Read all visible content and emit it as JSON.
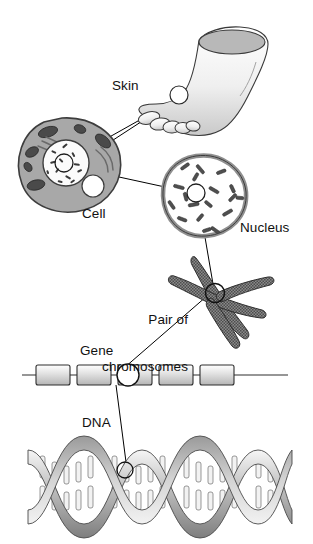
{
  "figure": {
    "background_color": "#ffffff",
    "width": 313,
    "height": 544,
    "line_color": "#000000",
    "ink_color": "#111111"
  },
  "labels": {
    "skin": "Skin",
    "cell": "Cell",
    "nucleus": "Nucleus",
    "chromosomes_line1": "Pair of",
    "chromosomes_line2": "chromosomes",
    "gene": "Gene",
    "dna": "DNA"
  },
  "levels": [
    {
      "id": "skin",
      "label": "Skin",
      "description": "Foot and lower leg with a circular callout marker on the top of the foot",
      "marker": {
        "cx": 179,
        "cy": 95,
        "r": 9
      }
    },
    {
      "id": "cell",
      "label": "Cell",
      "description": "Skin cell with cytoplasm, mitochondria, endoplasmic reticulum, vacuole and a central nucleus",
      "marker": {
        "cx": 64,
        "cy": 163,
        "r": 9
      },
      "fill": "#a8a8a8",
      "organelle_fill": "#4a4a4a",
      "vacuole_fill": "#ffffff"
    },
    {
      "id": "nucleus",
      "label": "Nucleus",
      "description": "Nucleus enlarged showing many scattered chromosomes inside the nuclear envelope",
      "marker": {
        "cx": 196,
        "cy": 193,
        "r": 9
      },
      "envelope_fill": "#8f8f8f",
      "interior_fill": "#ffffff"
    },
    {
      "id": "chromosomes",
      "label": "Pair of chromosomes",
      "description": "Two X-shaped homologous chromosomes crossing at the centromere region",
      "marker": {
        "cx": 215,
        "cy": 293,
        "r": 9
      },
      "fill": "#6f6f6f"
    },
    {
      "id": "gene",
      "label": "Gene",
      "description": "Linear strand with five shaded gene boxes; the middle box is circled",
      "marker": {
        "cx": 118,
        "cy": 375,
        "r": 10
      },
      "box_count": 5,
      "highlighted_box_index": 2,
      "fill": "#dcdcdc"
    },
    {
      "id": "dna",
      "label": "DNA",
      "description": "DNA double helix with base-pair rungs; one base pair is circled",
      "marker": {
        "cx": 125,
        "cy": 470,
        "r": 8
      },
      "turns": 4,
      "ribbon_fill": "#b4b4b4",
      "base_fill": "#f2f2f2"
    }
  ],
  "connectors": [
    {
      "from": "skin",
      "to": "cell"
    },
    {
      "from": "cell",
      "to": "nucleus"
    },
    {
      "from": "nucleus",
      "to": "chromosomes"
    },
    {
      "from": "chromosomes",
      "to": "gene"
    },
    {
      "from": "gene",
      "to": "dna"
    }
  ],
  "dna_bases": [
    "T",
    "A",
    "C",
    "G",
    "T",
    "A",
    "G",
    "C",
    "A",
    "T",
    "C",
    "G"
  ]
}
